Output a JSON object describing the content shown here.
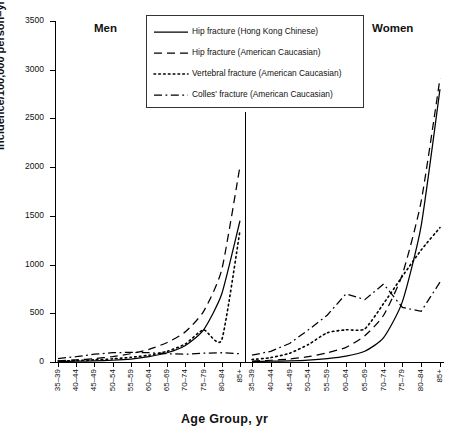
{
  "figure": {
    "panel_labels": {
      "men": "Men",
      "women": "Women"
    },
    "axis_title_y": "Incidence/100,000 person–yr",
    "axis_title_x": "Age Group, yr"
  },
  "legend": {
    "position": "top-center",
    "items": [
      {
        "label": "Hip fracture (Hong Kong Chinese)",
        "style": "solid",
        "icon": "solid-line-icon"
      },
      {
        "label": "Hip fracture (American Caucasian)",
        "style": "dashed",
        "icon": "dashed-line-icon"
      },
      {
        "label": "Vertebral fracture  (American Caucasian)",
        "style": "dotted",
        "icon": "dotted-line-icon"
      },
      {
        "label": "Colles' fracture (American Caucasian)",
        "style": "dashdot",
        "icon": "dashdot-line-icon"
      }
    ]
  },
  "chart_data": {
    "type": "line",
    "title": "",
    "xlabel": "Age Group, yr",
    "ylabel": "Incidence/100,000 person–yr",
    "ylim": [
      0,
      3500
    ],
    "yticks": [
      0,
      500,
      1000,
      1500,
      2000,
      2500,
      3000,
      3500
    ],
    "ytick_labels": [
      "0",
      "500",
      "1000",
      "1500",
      "2000",
      "2500",
      "3000",
      "3500"
    ],
    "grid": false,
    "legend_position": "top-center",
    "panels": [
      {
        "name": "Men",
        "categories": [
          "35–39",
          "40–44",
          "45–49",
          "50–54",
          "55–59",
          "60–64",
          "65–69",
          "70–74",
          "75–79",
          "80–84",
          "85+"
        ],
        "series": [
          {
            "name": "Hip fracture (Hong Kong Chinese)",
            "style": "solid",
            "values": [
              5,
              8,
              12,
              18,
              30,
              55,
              95,
              170,
              330,
              700,
              1450
            ]
          },
          {
            "name": "Hip fracture (American Caucasian)",
            "style": "dashed",
            "values": [
              12,
              22,
              35,
              55,
              85,
              130,
              200,
              310,
              520,
              950,
              2010
            ]
          },
          {
            "name": "Vertebral fracture (American Caucasian)",
            "style": "dotted",
            "values": [
              10,
              15,
              22,
              32,
              48,
              70,
              110,
              185,
              330,
              230,
              1350
            ]
          },
          {
            "name": "Colles' fracture (American Caucasian)",
            "style": "dashdot",
            "values": [
              35,
              55,
              80,
              95,
              100,
              95,
              85,
              80,
              90,
              95,
              85
            ]
          }
        ]
      },
      {
        "name": "Women",
        "categories": [
          "35–39",
          "40–44",
          "45–49",
          "50–54",
          "55–59",
          "60–64",
          "65–69",
          "70–74",
          "75–79",
          "80–84",
          "85+"
        ],
        "series": [
          {
            "name": "Hip fracture (Hong Kong Chinese)",
            "style": "solid",
            "values": [
              5,
              8,
              12,
              20,
              35,
              60,
              110,
              250,
              620,
              1400,
              2800
            ]
          },
          {
            "name": "Hip fracture (American Caucasian)",
            "style": "dashed",
            "values": [
              10,
              18,
              30,
              55,
              95,
              150,
              270,
              480,
              900,
              1650,
              2910
            ]
          },
          {
            "name": "Vertebral fracture (American Caucasian)",
            "style": "dotted",
            "values": [
              25,
              45,
              90,
              180,
              300,
              330,
              340,
              600,
              880,
              1150,
              1380
            ]
          },
          {
            "name": "Colles' fracture (American Caucasian)",
            "style": "dashdot",
            "values": [
              70,
              110,
              190,
              330,
              480,
              700,
              640,
              800,
              560,
              520,
              820
            ]
          }
        ]
      }
    ]
  }
}
